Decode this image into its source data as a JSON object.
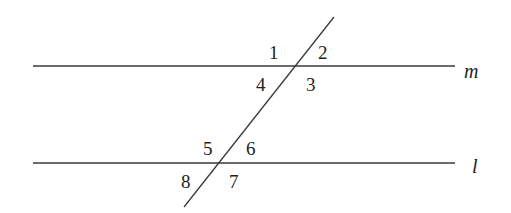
{
  "diagram": {
    "type": "parallel-lines-cut-by-transversal",
    "lines": {
      "m": {
        "label": "m",
        "y": 66,
        "x1": 33,
        "x2": 455
      },
      "l": {
        "label": "l",
        "y": 163,
        "x1": 33,
        "x2": 455
      }
    },
    "transversal": {
      "x1": 334,
      "y1": 17,
      "x2": 184,
      "y2": 207
    },
    "angles": [
      {
        "id": "1",
        "label": "1"
      },
      {
        "id": "2",
        "label": "2"
      },
      {
        "id": "3",
        "label": "3"
      },
      {
        "id": "4",
        "label": "4"
      },
      {
        "id": "5",
        "label": "5"
      },
      {
        "id": "6",
        "label": "6"
      },
      {
        "id": "7",
        "label": "7"
      },
      {
        "id": "8",
        "label": "8"
      }
    ],
    "colors": {
      "stroke": "#3a3a3a",
      "text": "#231f20",
      "background": "#ffffff"
    }
  }
}
